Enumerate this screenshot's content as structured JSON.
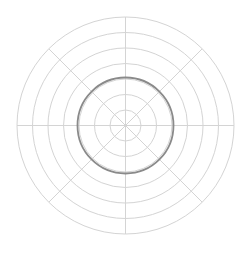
{
  "chart_data": {
    "type": "polar",
    "title": "",
    "center": [
      125.5,
      125.5
    ],
    "ring_count": 7,
    "ring_step": 15.5,
    "ring_radii": [
      15.5,
      31,
      46.5,
      62,
      77.5,
      93,
      108.5
    ],
    "highlighted_ring_index": 2,
    "spoke_angles_deg": [
      0,
      45,
      90,
      135,
      180,
      225,
      270,
      315
    ],
    "tick_labels": [],
    "legend": [],
    "grid": true,
    "colors": {
      "grid": "#d4d4d4",
      "highlight": "#8a8a8a",
      "background": "#ffffff"
    }
  }
}
